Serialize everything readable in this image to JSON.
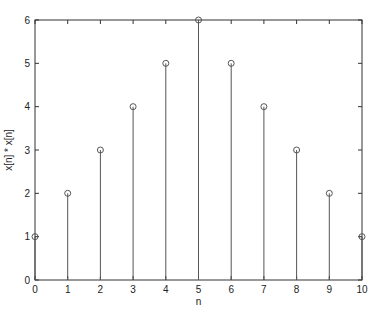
{
  "chart_data": {
    "type": "stem",
    "title": "",
    "xlabel": "n",
    "ylabel": "x[n] * x[n]",
    "x": [
      0,
      1,
      2,
      3,
      4,
      5,
      6,
      7,
      8,
      9,
      10
    ],
    "values": [
      1,
      2,
      3,
      4,
      5,
      6,
      5,
      4,
      3,
      2,
      1
    ],
    "xlim": [
      0,
      10
    ],
    "ylim": [
      0,
      6
    ],
    "xticks": [
      "0",
      "1",
      "2",
      "3",
      "4",
      "5",
      "6",
      "7",
      "8",
      "9",
      "10"
    ],
    "yticks": [
      "0",
      "1",
      "2",
      "3",
      "4",
      "5",
      "6"
    ],
    "grid": false,
    "legend": null,
    "marker": "circle-open",
    "line_color": "#555555"
  }
}
